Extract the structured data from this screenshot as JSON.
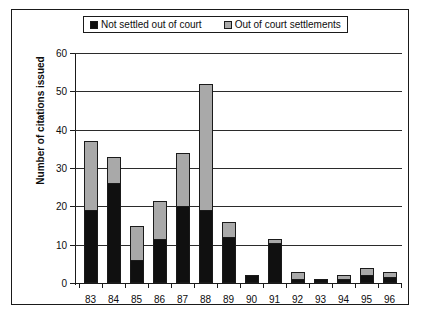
{
  "chart_data": {
    "type": "bar",
    "stacked": true,
    "title": "",
    "xlabel": "",
    "ylabel": "Number of citations issued",
    "ylim": [
      0,
      60
    ],
    "ytick_labels": [
      "0",
      "10",
      "20",
      "30",
      "40",
      "50",
      "60"
    ],
    "yticks": [
      0,
      10,
      20,
      30,
      40,
      50,
      60
    ],
    "grid": "horizontal",
    "legend_position": "top",
    "categories": [
      "83",
      "84",
      "85",
      "86",
      "87",
      "88",
      "89",
      "90",
      "91",
      "92",
      "93",
      "94",
      "95",
      "96"
    ],
    "series": [
      {
        "name": "Not settled out of court",
        "color": "#101010",
        "values": [
          19,
          26,
          6,
          11.5,
          20,
          19,
          12,
          2,
          10.5,
          1,
          1,
          1,
          2,
          1.5
        ]
      },
      {
        "name": "Out of court settlements",
        "color": "#a9a9a9",
        "values": [
          18,
          7,
          9,
          10,
          14,
          33,
          4,
          0,
          1,
          2,
          0,
          1,
          2,
          1.5
        ]
      }
    ],
    "totals": [
      37,
      33,
      15,
      21.5,
      34,
      52,
      16,
      2,
      11.5,
      3,
      1,
      2,
      4,
      3
    ]
  },
  "legend": {
    "entries": [
      {
        "label": "Not settled out of court",
        "swatch": "black-square-icon"
      },
      {
        "label": "Out of court settlements",
        "swatch": "gray-square-icon"
      }
    ]
  },
  "axes": {
    "y_title": "Number of citations issued"
  }
}
